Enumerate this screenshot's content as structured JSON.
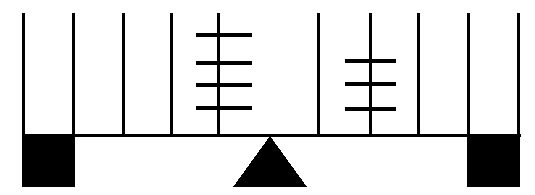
{
  "figure": {
    "canvas": {
      "width": 535,
      "height": 195
    },
    "colors": {
      "ink": "#000000",
      "background": "#ffffff"
    },
    "beam": {
      "x1": 22,
      "x2": 521,
      "y": 135.5,
      "thickness": 3
    },
    "fulcrum": {
      "apex_x": 270,
      "apex_y": 136,
      "base_left_x": 233,
      "base_right_x": 307,
      "base_y": 187
    },
    "blocks": [
      {
        "name": "left-weight-block",
        "x": 22,
        "y": 135,
        "width": 53,
        "height": 52
      },
      {
        "name": "right-weight-block",
        "x": 467,
        "y": 135,
        "width": 53,
        "height": 52
      }
    ],
    "verticals": [
      {
        "x": 23,
        "y_top": 13,
        "y_bottom": 136
      },
      {
        "x": 73,
        "y_top": 13,
        "y_bottom": 136
      },
      {
        "x": 123,
        "y_top": 13,
        "y_bottom": 136
      },
      {
        "x": 171,
        "y_top": 13,
        "y_bottom": 136
      },
      {
        "x": 218,
        "y_top": 13,
        "y_bottom": 136
      },
      {
        "x": 318,
        "y_top": 13,
        "y_bottom": 136
      },
      {
        "x": 370,
        "y_top": 13,
        "y_bottom": 136
      },
      {
        "x": 418,
        "y_top": 13,
        "y_bottom": 136
      },
      {
        "x": 468,
        "y_top": 13,
        "y_bottom": 136
      },
      {
        "x": 518,
        "y_top": 13,
        "y_bottom": 136
      }
    ],
    "tally_groups": [
      {
        "name": "left-tally-group",
        "stem_x": 218,
        "crossbar_x1": 196,
        "crossbar_x2": 252,
        "crossbar_count": 4,
        "crossbar_y": [
          35,
          63,
          85,
          108
        ]
      },
      {
        "name": "right-tally-group",
        "stem_x": 370,
        "crossbar_x1": 345,
        "crossbar_x2": 396,
        "crossbar_count": 3,
        "crossbar_y": [
          61,
          84,
          109
        ]
      }
    ],
    "stroke_widths": {
      "vertical": 3,
      "crossbar": 3.5,
      "beam": 3
    }
  }
}
